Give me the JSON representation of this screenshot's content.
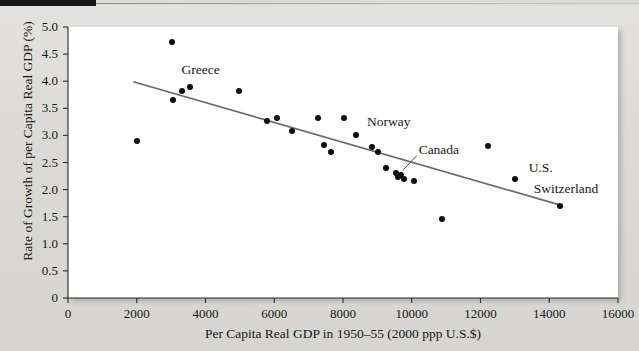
{
  "figure": {
    "background_color": "#dcdbd8",
    "plot_background_color": "#ffffff",
    "marker_color": "#0d0d0f",
    "trendline_color": "#6b6b6b"
  },
  "chart_data": {
    "type": "scatter",
    "title": "",
    "xlabel": "Per Capita Real GDP in 1950–55 (2000 ppp U.S.$)",
    "ylabel": "Rate of Growth of per Capita Real GDP (%)",
    "xlim": [
      0,
      16000
    ],
    "ylim": [
      0,
      5.0
    ],
    "xticks": [
      0,
      2000,
      4000,
      6000,
      8000,
      10000,
      12000,
      14000,
      16000
    ],
    "xticklabels": [
      "0",
      "2000",
      "4000",
      "6000",
      "8000",
      "10000",
      "12000",
      "14000",
      "16000"
    ],
    "yticks": [
      0,
      0.5,
      1.0,
      1.5,
      2.0,
      2.5,
      3.0,
      3.5,
      4.0,
      4.5,
      5.0
    ],
    "yticklabels": [
      "0",
      "0.5",
      "1.0",
      "1.5",
      "2.0",
      "2.5",
      "3.0",
      "3.5",
      "4.0",
      "4.5",
      "5.0"
    ],
    "grid": false,
    "legend": null,
    "points": [
      {
        "x": 2000,
        "y": 2.9,
        "label": ""
      },
      {
        "x": 3030,
        "y": 4.72,
        "label": ""
      },
      {
        "x": 3060,
        "y": 3.65,
        "label": "Greece"
      },
      {
        "x": 3330,
        "y": 3.81,
        "label": ""
      },
      {
        "x": 3540,
        "y": 3.9,
        "label": ""
      },
      {
        "x": 4970,
        "y": 3.82,
        "label": ""
      },
      {
        "x": 5790,
        "y": 3.26,
        "label": ""
      },
      {
        "x": 6090,
        "y": 3.32,
        "label": ""
      },
      {
        "x": 6520,
        "y": 3.08,
        "label": ""
      },
      {
        "x": 7270,
        "y": 3.32,
        "label": ""
      },
      {
        "x": 7450,
        "y": 2.82,
        "label": ""
      },
      {
        "x": 7640,
        "y": 2.7,
        "label": ""
      },
      {
        "x": 8030,
        "y": 3.33,
        "label": "Norway"
      },
      {
        "x": 8370,
        "y": 3.0,
        "label": ""
      },
      {
        "x": 8830,
        "y": 2.78,
        "label": ""
      },
      {
        "x": 9020,
        "y": 2.7,
        "label": ""
      },
      {
        "x": 9250,
        "y": 2.4,
        "label": ""
      },
      {
        "x": 9540,
        "y": 2.31,
        "label": ""
      },
      {
        "x": 9590,
        "y": 2.24,
        "label": ""
      },
      {
        "x": 9690,
        "y": 2.27,
        "label": "Canada"
      },
      {
        "x": 9780,
        "y": 2.2,
        "label": ""
      },
      {
        "x": 10060,
        "y": 2.16,
        "label": ""
      },
      {
        "x": 10880,
        "y": 1.46,
        "label": ""
      },
      {
        "x": 12220,
        "y": 2.8,
        "label": ""
      },
      {
        "x": 13010,
        "y": 2.2,
        "label": "U.S."
      },
      {
        "x": 14320,
        "y": 1.7,
        "label": "Switzerland"
      }
    ],
    "trendline": {
      "x0": 1900,
      "y0": 3.99,
      "x1": 14400,
      "y1": 1.7
    },
    "annotations": [
      {
        "text": "Greece",
        "x": 3300,
        "y": 4.18,
        "leader": false
      },
      {
        "text": "Norway",
        "x": 8700,
        "y": 3.22,
        "leader": false
      },
      {
        "text": "Canada",
        "x": 10200,
        "y": 2.72,
        "leader": true
      },
      {
        "text": "U.S.",
        "x": 13400,
        "y": 2.38,
        "leader": false
      },
      {
        "text": "Switzerland",
        "x": 13550,
        "y": 2.0,
        "leader": false
      }
    ]
  }
}
